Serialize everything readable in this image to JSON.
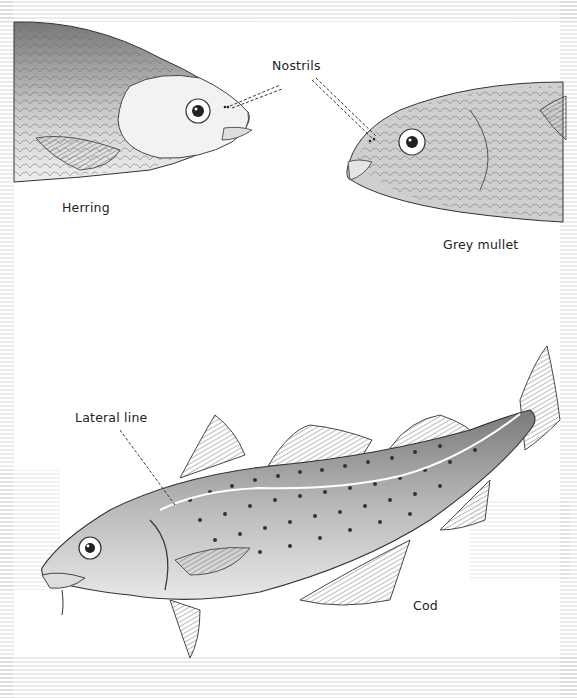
{
  "labels": {
    "nostrils": "Nostrils",
    "herring": "Herring",
    "grey_mullet": "Grey mullet",
    "lateral_line": "Lateral line",
    "cod": "Cod"
  },
  "colors": {
    "ink": "#222222",
    "shade_dark": "#555555",
    "shade_mid": "#8a8a8a",
    "shade_light": "#c8c8c8",
    "paper": "#ffffff"
  }
}
